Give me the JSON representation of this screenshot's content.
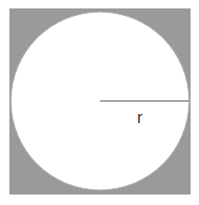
{
  "figure": {
    "canvas": {
      "width": 199,
      "height": 205,
      "background_color": "#ffffff"
    },
    "square": {
      "name": "gray-square",
      "x": 10,
      "y": 9,
      "width": 180,
      "height": 185,
      "fill_color": "#9a9a9a",
      "stroke_color": "#8e8e8e"
    },
    "circle": {
      "name": "white-circle",
      "center_x": 100,
      "center_y": 101,
      "radius": 89,
      "fill_color": "#ffffff",
      "stroke_color": "#b8b8b8",
      "stroke_width": 1
    },
    "radius_line": {
      "name": "radius-segment",
      "x1": 100,
      "y1": 101,
      "x2": 189,
      "y2": 101,
      "stroke_color": "#8a8a8a",
      "stroke_width": 1.4
    },
    "radius_label": {
      "text": "r",
      "x": 137,
      "y": 123,
      "color": "#3a3a3a",
      "font_size": 17
    }
  }
}
